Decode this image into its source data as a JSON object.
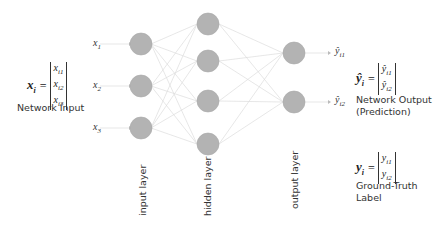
{
  "diagram": {
    "type": "feedforward-neural-network",
    "layers": [
      {
        "name": "input layer",
        "nodes": 3
      },
      {
        "name": "hidden layer",
        "nodes": 4
      },
      {
        "name": "output layer",
        "nodes": 2
      }
    ],
    "node_color": "#b3b3b3",
    "edge_color": "#d9d9d9"
  },
  "inputs": {
    "x1": "x",
    "x1_sub": "1",
    "x2": "x",
    "x2_sub": "2",
    "x3": "x",
    "x3_sub": "3"
  },
  "outputs": {
    "y1": "ŷ",
    "y1_sub": "i1",
    "y2": "ŷ",
    "y2_sub": "i2"
  },
  "input_vector": {
    "lhs": "x",
    "lhs_sub": "i",
    "eq": "=",
    "cells": [
      "x",
      "x",
      "x"
    ],
    "cell_subs": [
      "i1",
      "i2",
      "i3"
    ],
    "caption": "Network Input"
  },
  "output_vector": {
    "lhs": "ŷ",
    "lhs_sub": "i",
    "eq": "=",
    "cells": [
      "ŷ",
      "ŷ"
    ],
    "cell_subs": [
      "i1",
      "i2"
    ],
    "caption_line1": "Network Output",
    "caption_line2": "(Prediction)"
  },
  "truth_vector": {
    "lhs": "y",
    "lhs_sub": "i",
    "eq": "=",
    "cells": [
      "y",
      "y"
    ],
    "cell_subs": [
      "i1",
      "i2"
    ],
    "caption_line1": "Ground-Truth",
    "caption_line2": "Label"
  },
  "layer_labels": {
    "input": "input layer",
    "hidden": "hidden layer",
    "output": "output layer"
  }
}
